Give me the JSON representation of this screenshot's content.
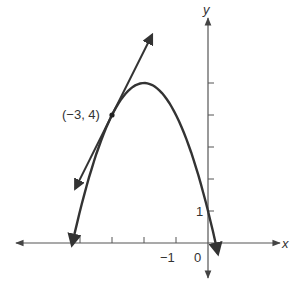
{
  "chart_data": {
    "type": "line",
    "title": "",
    "xlabel": "x",
    "ylabel": "y",
    "function": "y = -(x + 2)^2 + 5",
    "series": [
      {
        "name": "parabola",
        "x": [
          -4.25,
          -4.0,
          -3.5,
          -3.0,
          -2.5,
          -2.0,
          -1.5,
          -1.0,
          -0.5,
          0.0,
          0.31
        ],
        "values": [
          -0.06,
          1.0,
          2.75,
          4.0,
          4.75,
          5.0,
          4.75,
          4.0,
          2.75,
          1.0,
          -0.34
        ]
      },
      {
        "name": "tangent line at (-3, 4)",
        "x": [
          -4.15,
          -1.75
        ],
        "values": [
          1.7,
          6.5
        ]
      }
    ],
    "annotations": [
      {
        "text": "(−3, 4)",
        "x": -3,
        "y": 4,
        "marker": "point"
      }
    ],
    "x_tick_labels": [
      {
        "value": -1,
        "label": "−1"
      },
      {
        "value": 0,
        "label": "0"
      }
    ],
    "y_tick_labels": [
      {
        "value": 1,
        "label": "1"
      }
    ],
    "x_ticks": [
      -4,
      -3,
      -2,
      -1
    ],
    "y_ticks": [
      1,
      2,
      3,
      4,
      5
    ],
    "xlim": [
      -6.2,
      2.5
    ],
    "ylim": [
      -1.1,
      7.3
    ],
    "grid": false,
    "legend": "none"
  },
  "labels": {
    "x_axis": "x",
    "y_axis": "y",
    "origin": "0",
    "x_minus_one": "−1",
    "y_one": "1",
    "point": "(−3, 4)"
  },
  "colors": {
    "ink": "#333333",
    "axis": "#555555",
    "background": "#ffffff"
  }
}
